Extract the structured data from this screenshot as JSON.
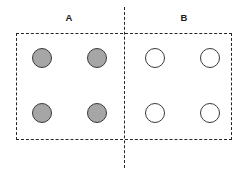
{
  "figure": {
    "width": 248,
    "height": 173,
    "background_color": "#ffffff",
    "line_color": "#262626",
    "line_style": "dashed"
  },
  "groups": [
    {
      "id": "A",
      "label": "A",
      "label_position": {
        "x": 69,
        "y": 18
      },
      "fill_state": "filled",
      "fill_color": "#a6a6a6",
      "node_count": 4
    },
    {
      "id": "B",
      "label": "B",
      "label_position": {
        "x": 184,
        "y": 18
      },
      "fill_state": "hollow",
      "fill_color": "#ffffff",
      "node_count": 4
    }
  ],
  "outer_box": {
    "x": 16,
    "y": 33,
    "width": 216,
    "height": 107,
    "border_color": "#262626",
    "border_style": "dashed"
  },
  "divider": {
    "orientation": "vertical",
    "x": 124,
    "y_start": 7,
    "y_end": 168,
    "color": "#262626",
    "style": "dashed"
  },
  "nodes": [
    {
      "group": "A",
      "row": 1,
      "col": 1,
      "cx": 42,
      "cy": 58,
      "r": 10,
      "state": "filled",
      "fill": "#a6a6a6",
      "stroke": "#3a3a3a"
    },
    {
      "group": "A",
      "row": 1,
      "col": 2,
      "cx": 97,
      "cy": 58,
      "r": 10,
      "state": "filled",
      "fill": "#a6a6a6",
      "stroke": "#3a3a3a"
    },
    {
      "group": "A",
      "row": 2,
      "col": 1,
      "cx": 42,
      "cy": 113,
      "r": 10,
      "state": "filled",
      "fill": "#a6a6a6",
      "stroke": "#3a3a3a"
    },
    {
      "group": "A",
      "row": 2,
      "col": 2,
      "cx": 97,
      "cy": 113,
      "r": 10,
      "state": "filled",
      "fill": "#a6a6a6",
      "stroke": "#3a3a3a"
    },
    {
      "group": "B",
      "row": 1,
      "col": 1,
      "cx": 155,
      "cy": 58,
      "r": 10,
      "state": "hollow",
      "fill": "#ffffff",
      "stroke": "#3a3a3a"
    },
    {
      "group": "B",
      "row": 1,
      "col": 2,
      "cx": 210,
      "cy": 58,
      "r": 10,
      "state": "hollow",
      "fill": "#ffffff",
      "stroke": "#3a3a3a"
    },
    {
      "group": "B",
      "row": 2,
      "col": 1,
      "cx": 155,
      "cy": 113,
      "r": 10,
      "state": "hollow",
      "fill": "#ffffff",
      "stroke": "#3a3a3a"
    },
    {
      "group": "B",
      "row": 2,
      "col": 2,
      "cx": 210,
      "cy": 113,
      "r": 10,
      "state": "hollow",
      "fill": "#ffffff",
      "stroke": "#3a3a3a"
    }
  ]
}
